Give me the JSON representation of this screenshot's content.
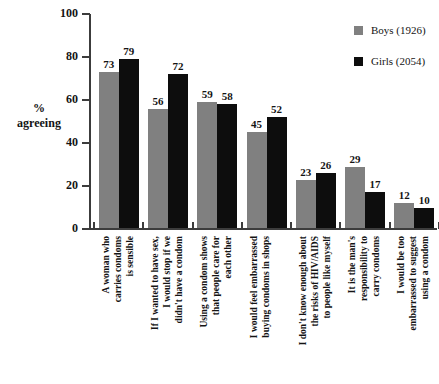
{
  "chart_data": {
    "type": "bar",
    "title": "",
    "xlabel": "",
    "ylabel": "%\nagreeing",
    "ylim": [
      0,
      100
    ],
    "yticks": [
      0,
      20,
      40,
      60,
      80,
      100
    ],
    "grid": false,
    "legend_position": "top-right",
    "categories": [
      "A woman who\ncarries condoms\nis sensible",
      "If I wanted to have sex,\nI would stop if we\ndidn't have a condom",
      "Using a condom shows\nthat people care for\neach other",
      "I would feel embarrassed\nbuying condoms in shops",
      "I don't know enough about\nthe risks of HIV/AIDS\nto people like myself",
      "It is the man's\nresponsibility to\ncarry condoms",
      "I would be too\nembarrassed to suggest\nusing a condom"
    ],
    "series": [
      {
        "name": "Boys (1926)",
        "color": "#808080",
        "values": [
          73,
          56,
          59,
          45,
          23,
          29,
          12
        ]
      },
      {
        "name": "Girls (2054)",
        "color": "#0d0d0d",
        "values": [
          79,
          72,
          58,
          52,
          26,
          17,
          10
        ]
      }
    ]
  },
  "axis": {
    "y_title_line1": "%",
    "y_title_line2": "agreeing",
    "y_tick_labels": [
      "100",
      "80",
      "60",
      "40",
      "20",
      "0"
    ]
  },
  "legend": {
    "items": [
      {
        "label": "Boys (1926)",
        "color": "#808080"
      },
      {
        "label": "Girls (2054)",
        "color": "#0d0d0d"
      }
    ]
  }
}
